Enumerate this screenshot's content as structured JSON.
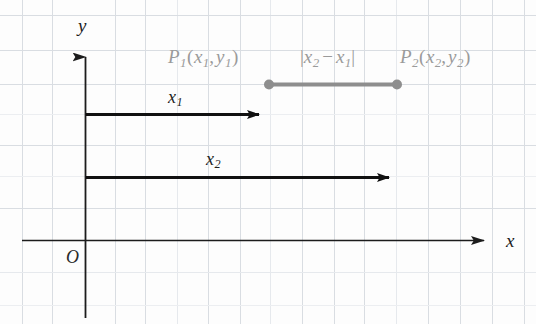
{
  "figure": {
    "background_color": "#fdfdfd",
    "grid_color": "#d9dde2",
    "grid_color_faint": "#e9ecef",
    "axis_color": "#1c1c1c",
    "vector_color": "#111111",
    "segment_color": "#8e8e8e",
    "label_gray": "#9a9a9a"
  },
  "axes": {
    "x_label": "x",
    "y_label": "y",
    "origin_label": "O",
    "x_axis": {
      "y": 240,
      "x_start": 22,
      "x_end": 497
    },
    "y_axis": {
      "x": 85,
      "y_start": 318,
      "y_end": 44
    }
  },
  "grid": {
    "vertical_x": [
      22,
      52,
      115,
      145,
      177,
      208,
      240,
      270,
      302,
      334,
      364,
      396,
      428,
      460,
      492,
      524
    ],
    "horizontal_y": [
      15,
      50,
      84,
      114,
      145,
      176,
      208,
      240,
      272,
      305
    ],
    "faint_horizontal_y": [
      114,
      176,
      272
    ],
    "spacing_x": 31,
    "spacing_y": 32
  },
  "vectors": [
    {
      "name": "x1-vector",
      "label": "x",
      "subscript": "1",
      "y": 114,
      "x_start": 86,
      "x_end": 272,
      "label_x": 168,
      "label_y": 88
    },
    {
      "name": "x2-vector",
      "label": "x",
      "subscript": "2",
      "y": 177,
      "x_start": 86,
      "x_end": 402,
      "label_x": 206,
      "label_y": 150
    }
  ],
  "segment": {
    "name": "distance-segment",
    "y": 84,
    "x_start": 269,
    "x_end": 397,
    "dot_radius": 5
  },
  "annotations": {
    "p1": {
      "prefix": "P",
      "sub": "1",
      "open": "(",
      "arg1": "x",
      "arg1_sub": "1",
      "comma": ",",
      "arg2": "y",
      "arg2_sub": "1",
      "close": ")",
      "x": 168,
      "y": 47
    },
    "distance": {
      "bar_open": "|",
      "term1": "x",
      "term1_sub": "2",
      "minus": "−",
      "term2": "x",
      "term2_sub": "1",
      "bar_close": "|",
      "x": 300,
      "y": 47
    },
    "p2": {
      "prefix": "P",
      "sub": "2",
      "open": "(",
      "arg1": "x",
      "arg1_sub": "2",
      "comma": ",",
      "arg2": "y",
      "arg2_sub": "2",
      "close": ")",
      "x": 400,
      "y": 47
    }
  }
}
